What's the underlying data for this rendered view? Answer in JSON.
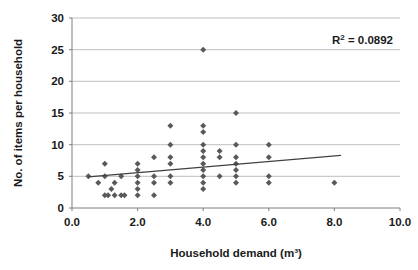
{
  "chart_data": {
    "type": "scatter",
    "title": "",
    "xlabel": "Household demand (m³)",
    "ylabel": "No. of items per household",
    "xlim": [
      0.0,
      10.0
    ],
    "ylim": [
      0,
      30
    ],
    "xticks": [
      "0.0",
      "2.0",
      "4.0",
      "6.0",
      "8.0",
      "10.0"
    ],
    "xtick_values": [
      0.0,
      2.0,
      4.0,
      6.0,
      8.0,
      10.0
    ],
    "yticks": [
      "0",
      "5",
      "10",
      "15",
      "20",
      "25",
      "30"
    ],
    "ytick_values": [
      0,
      5,
      10,
      15,
      20,
      25,
      30
    ],
    "grid": "horizontal",
    "legend": "none",
    "marker": "diamond",
    "marker_color": "#595959",
    "points": [
      [
        0.5,
        5
      ],
      [
        0.8,
        4
      ],
      [
        1.0,
        7
      ],
      [
        1.0,
        5
      ],
      [
        1.0,
        2
      ],
      [
        1.1,
        2
      ],
      [
        1.2,
        3
      ],
      [
        1.3,
        4
      ],
      [
        1.3,
        2
      ],
      [
        1.5,
        5
      ],
      [
        1.5,
        2
      ],
      [
        1.6,
        2
      ],
      [
        2.0,
        7
      ],
      [
        2.0,
        6
      ],
      [
        2.0,
        5
      ],
      [
        2.0,
        4
      ],
      [
        2.0,
        3
      ],
      [
        2.0,
        2
      ],
      [
        2.5,
        8
      ],
      [
        2.5,
        5
      ],
      [
        2.5,
        4
      ],
      [
        2.5,
        2
      ],
      [
        3.0,
        13
      ],
      [
        3.0,
        10
      ],
      [
        3.0,
        8
      ],
      [
        3.0,
        7
      ],
      [
        3.0,
        5
      ],
      [
        3.0,
        4
      ],
      [
        4.0,
        25
      ],
      [
        4.0,
        13
      ],
      [
        4.0,
        12
      ],
      [
        4.0,
        10
      ],
      [
        4.0,
        9
      ],
      [
        4.0,
        8
      ],
      [
        4.0,
        7
      ],
      [
        4.0,
        6
      ],
      [
        4.0,
        5
      ],
      [
        4.0,
        4
      ],
      [
        4.0,
        3
      ],
      [
        4.5,
        9
      ],
      [
        4.5,
        8
      ],
      [
        4.5,
        5
      ],
      [
        5.0,
        15
      ],
      [
        5.0,
        10
      ],
      [
        5.0,
        8
      ],
      [
        5.0,
        7
      ],
      [
        5.0,
        6
      ],
      [
        5.0,
        5
      ],
      [
        5.0,
        4
      ],
      [
        6.0,
        10
      ],
      [
        6.0,
        8
      ],
      [
        6.0,
        5
      ],
      [
        6.0,
        4
      ],
      [
        8.0,
        4
      ]
    ],
    "trendline": {
      "type": "linear",
      "x0": 0.5,
      "y0": 4.9,
      "x1": 8.2,
      "y1": 8.3,
      "color": "#404040"
    },
    "annotation": {
      "r_squared_prefix": "R",
      "r_squared_exponent": "2",
      "r_squared_value": " = 0.0892"
    }
  }
}
